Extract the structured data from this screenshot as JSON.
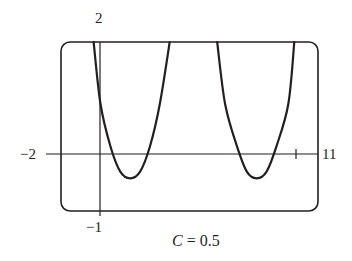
{
  "chart_data": {
    "type": "line",
    "title": "",
    "caption": {
      "variable": "C",
      "equals": " = ",
      "value": "0.5"
    },
    "window": {
      "xmin": -2,
      "xmax": 11,
      "ymin": -1,
      "ymax": 2
    },
    "labels": {
      "ymax": "2",
      "xmin": "−2",
      "xmax": "11",
      "ymin": "−1"
    },
    "xlabel": "",
    "ylabel": "",
    "grid": false,
    "axes": {
      "x_axis_y": 0,
      "y_axis_x": 0,
      "ticks_x": [
        10
      ]
    },
    "series": [
      {
        "name": "curve-1",
        "points": [
          [
            -0.35,
            2
          ],
          [
            0,
            0.9
          ],
          [
            0.5,
            0.15
          ],
          [
            1,
            -0.3
          ],
          [
            1.5,
            -0.42
          ],
          [
            2,
            -0.3
          ],
          [
            2.5,
            0.15
          ],
          [
            3,
            0.9
          ],
          [
            3.5,
            2
          ]
        ],
        "minimum": [
          1.5,
          -0.42
        ]
      },
      {
        "name": "curve-2",
        "points": [
          [
            5.9,
            2
          ],
          [
            6.3,
            0.9
          ],
          [
            6.9,
            0.15
          ],
          [
            7.4,
            -0.3
          ],
          [
            7.9,
            -0.42
          ],
          [
            8.4,
            -0.3
          ],
          [
            8.9,
            0.15
          ],
          [
            9.5,
            0.9
          ],
          [
            9.8,
            2
          ]
        ],
        "minimum": [
          7.9,
          -0.42
        ]
      }
    ]
  }
}
